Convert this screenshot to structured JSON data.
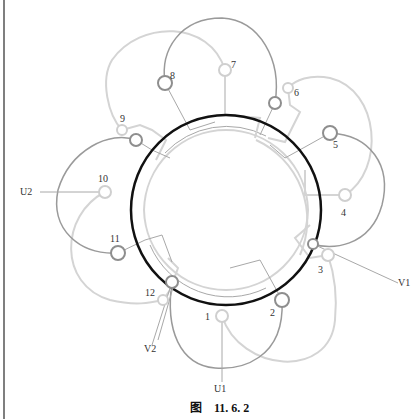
{
  "figure": {
    "caption_prefix": "图",
    "caption_number": "11. 6. 2"
  },
  "terminals": {
    "t1": "1",
    "t2": "2",
    "t3": "3",
    "t4": "4",
    "t5": "5",
    "t6": "6",
    "t7": "7",
    "t8": "8",
    "t9": "9",
    "t10": "10",
    "t11": "11",
    "t12": "12"
  },
  "leads": {
    "u1": "U1",
    "u2": "U2",
    "v1": "V1",
    "v2": "V2"
  },
  "colors": {
    "stator": "#111111",
    "coil_dark": "#9a9a9a",
    "coil_light": "#d4d4d4",
    "background": "#ffffff"
  }
}
